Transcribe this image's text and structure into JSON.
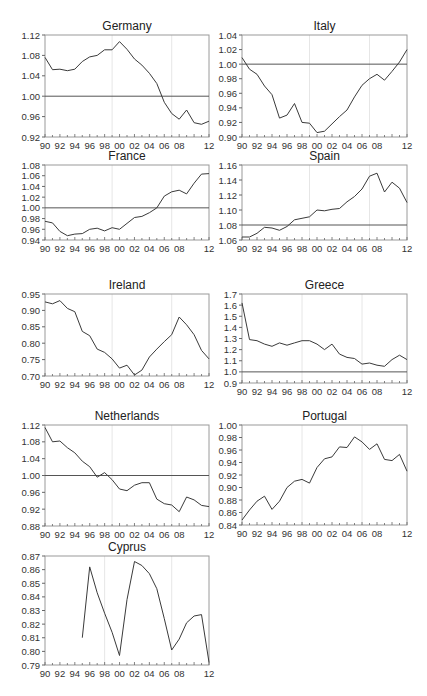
{
  "figure": {
    "years": [
      "90",
      "92",
      "94",
      "96",
      "98",
      "00",
      "02",
      "04",
      "06",
      "08",
      "12"
    ]
  },
  "chart_data": [
    {
      "type": "line",
      "title": "Germany",
      "xlabel": "",
      "ylabel": "",
      "xlim": [
        1990,
        2012
      ],
      "ylim": [
        0.92,
        1.12
      ],
      "yticks": [
        "1.12",
        "1.08",
        "1.04",
        "1.00",
        "0.96",
        "0.92"
      ],
      "xticks": [
        "90",
        "92",
        "94",
        "96",
        "98",
        "00",
        "02",
        "04",
        "06",
        "08",
        "12"
      ],
      "reference_line": 1.0,
      "vlines": [
        1999,
        2007
      ],
      "x": [
        1990,
        1991,
        1992,
        1993,
        1994,
        1995,
        1996,
        1997,
        1998,
        1999,
        2000,
        2001,
        2002,
        2003,
        2004,
        2005,
        2006,
        2007,
        2008,
        2009,
        2010,
        2011,
        2012
      ],
      "values": [
        1.076,
        1.052,
        1.053,
        1.05,
        1.053,
        1.068,
        1.077,
        1.08,
        1.091,
        1.091,
        1.107,
        1.092,
        1.073,
        1.061,
        1.045,
        1.025,
        0.988,
        0.966,
        0.955,
        0.973,
        0.948,
        0.945,
        0.951
      ]
    },
    {
      "type": "line",
      "title": "Italy",
      "xlabel": "",
      "ylabel": "",
      "xlim": [
        1990,
        2012
      ],
      "ylim": [
        0.9,
        1.04
      ],
      "yticks": [
        "1.04",
        "1.02",
        "1.00",
        "0.98",
        "0.96",
        "0.94",
        "0.92",
        "0.90"
      ],
      "xticks": [
        "90",
        "92",
        "94",
        "96",
        "98",
        "00",
        "02",
        "04",
        "06",
        "08",
        "12"
      ],
      "reference_line": 1.0,
      "vlines": [
        1999,
        2007
      ],
      "x": [
        1990,
        1991,
        1992,
        1993,
        1994,
        1995,
        1996,
        1997,
        1998,
        1999,
        2000,
        2001,
        2002,
        2003,
        2004,
        2005,
        2006,
        2007,
        2008,
        2009,
        2010,
        2011,
        2012
      ],
      "values": [
        1.009,
        0.993,
        0.986,
        0.97,
        0.958,
        0.926,
        0.93,
        0.946,
        0.92,
        0.919,
        0.906,
        0.908,
        0.918,
        0.928,
        0.937,
        0.955,
        0.971,
        0.98,
        0.986,
        0.978,
        0.99,
        1.003,
        1.02
      ]
    },
    {
      "type": "line",
      "title": "France",
      "xlabel": "",
      "ylabel": "",
      "xlim": [
        1990,
        2012
      ],
      "ylim": [
        0.94,
        1.08
      ],
      "yticks": [
        "1.08",
        "1.06",
        "1.04",
        "1.02",
        "1.00",
        "0.98",
        "0.96",
        "0.94"
      ],
      "xticks": [
        "90",
        "92",
        "94",
        "96",
        "98",
        "00",
        "02",
        "04",
        "06",
        "08",
        "12"
      ],
      "reference_line": 1.0,
      "vlines": [
        1999,
        2007
      ],
      "x": [
        1990,
        1991,
        1992,
        1993,
        1994,
        1995,
        1996,
        1997,
        1998,
        1999,
        2000,
        2001,
        2002,
        2003,
        2004,
        2005,
        2006,
        2007,
        2008,
        2009,
        2010,
        2011,
        2012
      ],
      "values": [
        0.975,
        0.972,
        0.956,
        0.948,
        0.951,
        0.952,
        0.96,
        0.962,
        0.957,
        0.963,
        0.96,
        0.971,
        0.982,
        0.984,
        0.991,
        1.0,
        1.022,
        1.03,
        1.033,
        1.026,
        1.046,
        1.063,
        1.064
      ]
    },
    {
      "type": "line",
      "title": "Spain",
      "xlabel": "",
      "ylabel": "",
      "xlim": [
        1990,
        2012
      ],
      "ylim": [
        1.06,
        1.16
      ],
      "yticks": [
        "1.16",
        "1.14",
        "1.12",
        "1.10",
        "1.08",
        "1.06"
      ],
      "xticks": [
        "90",
        "92",
        "94",
        "96",
        "98",
        "00",
        "02",
        "04",
        "06",
        "08",
        "12"
      ],
      "reference_line": 1.08,
      "vlines": [
        1999,
        2007
      ],
      "x": [
        1990,
        1991,
        1992,
        1993,
        1994,
        1995,
        1996,
        1997,
        1998,
        1999,
        2000,
        2001,
        2002,
        2003,
        2004,
        2005,
        2006,
        2007,
        2008,
        2009,
        2010,
        2011,
        2012
      ],
      "values": [
        1.064,
        1.064,
        1.069,
        1.077,
        1.076,
        1.073,
        1.078,
        1.087,
        1.089,
        1.091,
        1.1,
        1.099,
        1.101,
        1.102,
        1.111,
        1.118,
        1.128,
        1.145,
        1.149,
        1.124,
        1.137,
        1.129,
        1.11
      ]
    },
    {
      "type": "line",
      "title": "Ireland",
      "xlabel": "",
      "ylabel": "",
      "xlim": [
        1990,
        2012
      ],
      "ylim": [
        0.7,
        0.95
      ],
      "yticks": [
        "0.95",
        "0.90",
        "0.85",
        "0.80",
        "0.75",
        "0.70"
      ],
      "xticks": [
        "90",
        "92",
        "94",
        "96",
        "98",
        "00",
        "02",
        "04",
        "06",
        "08",
        "12"
      ],
      "reference_line": null,
      "vlines": [
        1999,
        2007
      ],
      "x": [
        1990,
        1991,
        1992,
        1993,
        1994,
        1995,
        1996,
        1997,
        1998,
        1999,
        2000,
        2001,
        2002,
        2003,
        2004,
        2005,
        2006,
        2007,
        2008,
        2009,
        2010,
        2011,
        2012
      ],
      "values": [
        0.926,
        0.92,
        0.93,
        0.906,
        0.896,
        0.836,
        0.823,
        0.782,
        0.772,
        0.752,
        0.724,
        0.733,
        0.703,
        0.718,
        0.758,
        0.782,
        0.805,
        0.826,
        0.88,
        0.856,
        0.826,
        0.778,
        0.752
      ]
    },
    {
      "type": "line",
      "title": "Greece",
      "xlabel": "",
      "ylabel": "",
      "xlim": [
        1990,
        2012
      ],
      "ylim": [
        0.9,
        1.7
      ],
      "yticks": [
        "1.7",
        "1.6",
        "1.5",
        "1.4",
        "1.3",
        "1.2",
        "1.1",
        "1.0",
        "0.9"
      ],
      "xticks": [
        "90",
        "92",
        "94",
        "96",
        "98",
        "00",
        "02",
        "04",
        "06",
        "08",
        "12"
      ],
      "reference_line": 1.0,
      "vlines": [
        1998,
        2006
      ],
      "x": [
        1990,
        1991,
        1992,
        1993,
        1994,
        1995,
        1996,
        1997,
        1998,
        1999,
        2000,
        2001,
        2002,
        2003,
        2004,
        2005,
        2006,
        2007,
        2008,
        2009,
        2010,
        2011,
        2012
      ],
      "values": [
        1.62,
        1.29,
        1.28,
        1.25,
        1.23,
        1.26,
        1.24,
        1.26,
        1.28,
        1.28,
        1.25,
        1.2,
        1.25,
        1.16,
        1.13,
        1.12,
        1.07,
        1.08,
        1.06,
        1.05,
        1.11,
        1.15,
        1.11
      ]
    },
    {
      "type": "line",
      "title": "Netherlands",
      "xlabel": "",
      "ylabel": "",
      "xlim": [
        1990,
        2012
      ],
      "ylim": [
        0.88,
        1.12
      ],
      "yticks": [
        "1.12",
        "1.08",
        "1.04",
        "1.00",
        "0.96",
        "0.92",
        "0.88"
      ],
      "xticks": [
        "90",
        "92",
        "94",
        "96",
        "98",
        "00",
        "02",
        "04",
        "06",
        "08",
        "12"
      ],
      "reference_line": 1.0,
      "vlines": [
        1999,
        2007
      ],
      "x": [
        1990,
        1991,
        1992,
        1993,
        1994,
        1995,
        1996,
        1997,
        1998,
        1999,
        2000,
        2001,
        2002,
        2003,
        2004,
        2005,
        2006,
        2007,
        2008,
        2009,
        2010,
        2011,
        2012
      ],
      "values": [
        1.114,
        1.08,
        1.082,
        1.066,
        1.054,
        1.034,
        1.021,
        0.996,
        1.007,
        0.99,
        0.968,
        0.964,
        0.977,
        0.983,
        0.983,
        0.944,
        0.933,
        0.93,
        0.914,
        0.949,
        0.942,
        0.929,
        0.926
      ]
    },
    {
      "type": "line",
      "title": "Portugal",
      "xlabel": "",
      "ylabel": "",
      "xlim": [
        1990,
        2012
      ],
      "ylim": [
        0.84,
        1.0
      ],
      "yticks": [
        "1.00",
        "0.98",
        "0.96",
        "0.94",
        "0.92",
        "0.90",
        "0.88",
        "0.86",
        "0.84"
      ],
      "xticks": [
        "90",
        "92",
        "94",
        "96",
        "98",
        "00",
        "02",
        "04",
        "06",
        "08",
        "12"
      ],
      "reference_line": null,
      "vlines": [
        1998,
        2006
      ],
      "x": [
        1990,
        1991,
        1992,
        1993,
        1994,
        1995,
        1996,
        1997,
        1998,
        1999,
        2000,
        2001,
        2002,
        2003,
        2004,
        2005,
        2006,
        2007,
        2008,
        2009,
        2010,
        2011,
        2012
      ],
      "values": [
        0.848,
        0.864,
        0.878,
        0.886,
        0.865,
        0.878,
        0.9,
        0.91,
        0.913,
        0.907,
        0.932,
        0.946,
        0.949,
        0.965,
        0.964,
        0.981,
        0.973,
        0.961,
        0.97,
        0.945,
        0.943,
        0.953,
        0.926
      ]
    },
    {
      "type": "line",
      "title": "Cyprus",
      "xlabel": "",
      "ylabel": "",
      "xlim": [
        1990,
        2012
      ],
      "ylim": [
        0.79,
        0.87
      ],
      "yticks": [
        "0.87",
        "0.86",
        "0.85",
        "0.84",
        "0.83",
        "0.82",
        "0.81",
        "0.80",
        "0.79"
      ],
      "xticks": [
        "90",
        "92",
        "94",
        "96",
        "98",
        "00",
        "02",
        "04",
        "06",
        "08",
        "12"
      ],
      "reference_line": null,
      "vlines": [
        1998,
        2007
      ],
      "x": [
        1995,
        1996,
        1997,
        1998,
        1999,
        2000,
        2001,
        2002,
        2003,
        2004,
        2005,
        2006,
        2007,
        2008,
        2009,
        2010,
        2011,
        2012
      ],
      "values": [
        0.81,
        0.862,
        0.843,
        0.828,
        0.814,
        0.797,
        0.838,
        0.866,
        0.863,
        0.857,
        0.846,
        0.824,
        0.801,
        0.809,
        0.821,
        0.826,
        0.827,
        0.792
      ]
    }
  ]
}
